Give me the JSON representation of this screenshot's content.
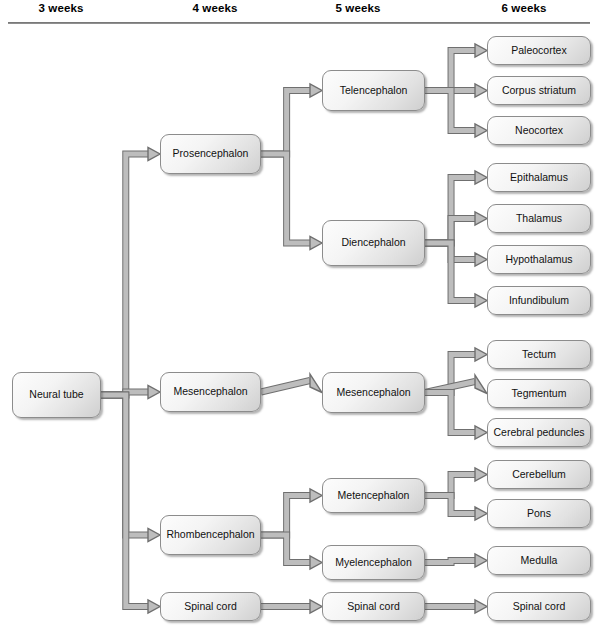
{
  "headers": [
    {
      "label": "3 weeks",
      "cx": 61
    },
    {
      "label": "4 weeks",
      "cx": 215
    },
    {
      "label": "5 weeks",
      "cx": 358
    },
    {
      "label": "6 weeks",
      "cx": 524
    }
  ],
  "nodes": [
    {
      "id": "neural-tube",
      "label": "Neural tube",
      "x": 12,
      "y": 372,
      "w": 89,
      "h": 46
    },
    {
      "id": "prosencephalon",
      "label": "Prosencephalon",
      "x": 160,
      "y": 134,
      "w": 101,
      "h": 40
    },
    {
      "id": "mesencephalon-4w",
      "label": "Mesencephalon",
      "x": 160,
      "y": 372,
      "w": 101,
      "h": 40
    },
    {
      "id": "rhombencephalon",
      "label": "Rhombencephalon",
      "x": 160,
      "y": 515,
      "w": 101,
      "h": 40
    },
    {
      "id": "spinal-cord-4w",
      "label": "Spinal cord",
      "x": 160,
      "y": 592,
      "w": 101,
      "h": 29
    },
    {
      "id": "telencephalon",
      "label": "Telencephalon",
      "x": 322,
      "y": 70,
      "w": 103,
      "h": 41
    },
    {
      "id": "diencephalon",
      "label": "Diencephalon",
      "x": 322,
      "y": 220,
      "w": 103,
      "h": 46
    },
    {
      "id": "mesencephalon-5w",
      "label": "Mesencephalon",
      "x": 322,
      "y": 372,
      "w": 103,
      "h": 41
    },
    {
      "id": "metencephalon",
      "label": "Metencephalon",
      "x": 322,
      "y": 478,
      "w": 103,
      "h": 35
    },
    {
      "id": "myelencephalon",
      "label": "Myelencephalon",
      "x": 322,
      "y": 545,
      "w": 103,
      "h": 35
    },
    {
      "id": "spinal-cord-5w",
      "label": "Spinal cord",
      "x": 322,
      "y": 592,
      "w": 103,
      "h": 29
    },
    {
      "id": "paleocortex",
      "label": "Paleocortex",
      "x": 487,
      "y": 36,
      "w": 104,
      "h": 29
    },
    {
      "id": "corpus-striatum",
      "label": "Corpus striatum",
      "x": 487,
      "y": 76,
      "w": 104,
      "h": 29
    },
    {
      "id": "neocortex",
      "label": "Neocortex",
      "x": 487,
      "y": 116,
      "w": 104,
      "h": 29
    },
    {
      "id": "epithalamus",
      "label": "Epithalamus",
      "x": 487,
      "y": 163,
      "w": 104,
      "h": 29
    },
    {
      "id": "thalamus",
      "label": "Thalamus",
      "x": 487,
      "y": 204,
      "w": 104,
      "h": 29
    },
    {
      "id": "hypothalamus",
      "label": "Hypothalamus",
      "x": 487,
      "y": 245,
      "w": 104,
      "h": 29
    },
    {
      "id": "infundibulum",
      "label": "Infundibulum",
      "x": 487,
      "y": 286,
      "w": 104,
      "h": 29
    },
    {
      "id": "tectum",
      "label": "Tectum",
      "x": 487,
      "y": 340,
      "w": 104,
      "h": 29
    },
    {
      "id": "tegmentum",
      "label": "Tegmentum",
      "x": 487,
      "y": 379,
      "w": 104,
      "h": 29
    },
    {
      "id": "cerebral-peduncles",
      "label": "Cerebral peduncles",
      "x": 487,
      "y": 418,
      "w": 104,
      "h": 29
    },
    {
      "id": "cerebellum",
      "label": "Cerebellum",
      "x": 487,
      "y": 460,
      "w": 104,
      "h": 29
    },
    {
      "id": "pons",
      "label": "Pons",
      "x": 487,
      "y": 499,
      "w": 104,
      "h": 29
    },
    {
      "id": "medulla",
      "label": "Medulla",
      "x": 487,
      "y": 546,
      "w": 104,
      "h": 29
    },
    {
      "id": "spinal-cord-6w",
      "label": "Spinal cord",
      "x": 487,
      "y": 592,
      "w": 104,
      "h": 29
    }
  ],
  "connections": [
    {
      "from": "neural-tube",
      "to": "prosencephalon"
    },
    {
      "from": "neural-tube",
      "to": "mesencephalon-4w"
    },
    {
      "from": "neural-tube",
      "to": "rhombencephalon"
    },
    {
      "from": "neural-tube",
      "to": "spinal-cord-4w"
    },
    {
      "from": "prosencephalon",
      "to": "telencephalon"
    },
    {
      "from": "prosencephalon",
      "to": "diencephalon"
    },
    {
      "from": "mesencephalon-4w",
      "to": "mesencephalon-5w"
    },
    {
      "from": "rhombencephalon",
      "to": "metencephalon"
    },
    {
      "from": "rhombencephalon",
      "to": "myelencephalon"
    },
    {
      "from": "spinal-cord-4w",
      "to": "spinal-cord-5w"
    },
    {
      "from": "telencephalon",
      "to": "paleocortex"
    },
    {
      "from": "telencephalon",
      "to": "corpus-striatum"
    },
    {
      "from": "telencephalon",
      "to": "neocortex"
    },
    {
      "from": "diencephalon",
      "to": "epithalamus"
    },
    {
      "from": "diencephalon",
      "to": "thalamus"
    },
    {
      "from": "diencephalon",
      "to": "hypothalamus"
    },
    {
      "from": "diencephalon",
      "to": "infundibulum"
    },
    {
      "from": "mesencephalon-5w",
      "to": "tectum"
    },
    {
      "from": "mesencephalon-5w",
      "to": "tegmentum"
    },
    {
      "from": "mesencephalon-5w",
      "to": "cerebral-peduncles"
    },
    {
      "from": "metencephalon",
      "to": "cerebellum"
    },
    {
      "from": "metencephalon",
      "to": "pons"
    },
    {
      "from": "myelencephalon",
      "to": "medulla"
    },
    {
      "from": "spinal-cord-5w",
      "to": "spinal-cord-6w"
    }
  ],
  "colors": {
    "wire_fill": "#bdbdbd",
    "wire_stroke": "#6f6f6f",
    "box_border": "#8c8c8c",
    "rule": "#7d7d7d",
    "text": "#111111"
  }
}
